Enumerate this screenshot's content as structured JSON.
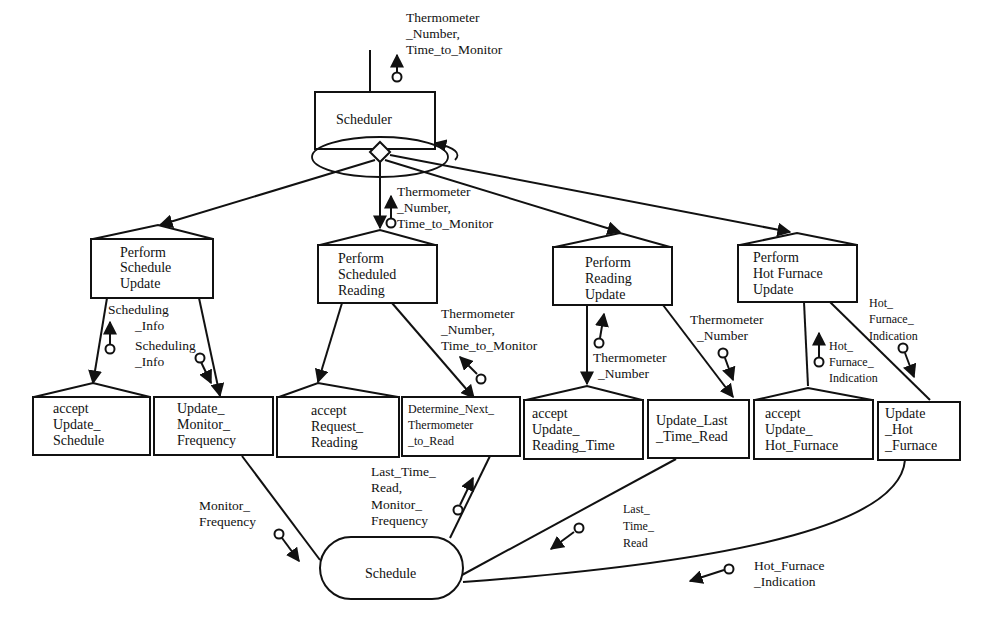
{
  "diagram": {
    "type": "structure chart",
    "root": {
      "label": "Scheduler",
      "input_flow": [
        "Thermometer",
        "_Number,",
        "Time_to_Monitor"
      ]
    },
    "level2": [
      {
        "id": "pss",
        "lines": [
          "Perform",
          "Schedule",
          "Update"
        ]
      },
      {
        "id": "psr",
        "lines": [
          "Perform",
          "Scheduled",
          "Reading"
        ]
      },
      {
        "id": "pru",
        "lines": [
          "Perform",
          "Reading",
          "Update"
        ]
      },
      {
        "id": "phf",
        "lines": [
          "Perform",
          "Hot Furnace",
          "Update"
        ]
      }
    ],
    "level3": [
      {
        "id": "aus",
        "lines": [
          "accept",
          "Update_",
          "Schedule"
        ]
      },
      {
        "id": "umf",
        "lines": [
          "Update_",
          "Monitor_",
          "Frequency"
        ]
      },
      {
        "id": "arr",
        "lines": [
          "accept",
          "Request_",
          "Reading"
        ]
      },
      {
        "id": "dnt",
        "lines": [
          "Determine_Next_",
          "Thermometer",
          "_to_Read"
        ]
      },
      {
        "id": "aurt",
        "lines": [
          "accept",
          "Update_",
          "Reading_Time"
        ]
      },
      {
        "id": "ultr",
        "lines": [
          "Update_Last",
          "_Time_Read"
        ]
      },
      {
        "id": "auhf",
        "lines": [
          "accept",
          "Update_",
          "Hot_Furnace"
        ]
      },
      {
        "id": "uhf",
        "lines": [
          "Update",
          "_Hot",
          "_Furnace"
        ]
      }
    ],
    "store": {
      "label": "Schedule"
    },
    "flows": {
      "psr_in": [
        "Thermometer",
        "_Number,",
        "Time_to_Monitor"
      ],
      "sched_info_up": [
        "Scheduling",
        "_Info"
      ],
      "sched_info_down": [
        "Scheduling",
        "_Info"
      ],
      "dnt_out": [
        "Thermometer",
        "_Number,",
        "Time_to_Monitor"
      ],
      "pru_up": [
        "Thermometer",
        "_Number"
      ],
      "pru_down": [
        "Thermometer",
        "_Number"
      ],
      "hf_up": [
        "Hot_",
        "Furnace_",
        "Indication"
      ],
      "hf_down": [
        "Hot_",
        "Furnace_",
        "Indication"
      ],
      "monitor_freq": [
        "Monitor_",
        "Frequency"
      ],
      "ltr_mf": [
        "Last_Time_",
        "Read,",
        "Monitor_",
        "Frequency"
      ],
      "last_time_read": [
        "Last_",
        "Time_",
        "Read"
      ],
      "hf_indication": [
        "Hot_Furnace",
        "_Indication"
      ]
    }
  }
}
